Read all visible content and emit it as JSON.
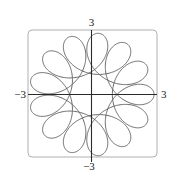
{
  "chart_data": {
    "type": "line",
    "title": "",
    "xlabel": "",
    "ylabel": "",
    "xlim": [
      -3,
      3
    ],
    "ylim": [
      -3,
      3
    ],
    "grid": false,
    "legend": null,
    "tick_labels": {
      "x_min": "−3",
      "x_max": "3",
      "y_min": "−3",
      "y_max": "3"
    },
    "curve": {
      "kind": "parametric",
      "description": "Closed parametric rosette curve with outer loops reaching radius ~3 and inward cusp points near radius ~1",
      "x_expr": "2cos(t) + cos(k t)",
      "y_expr": "2sin(t) - sin(k t)",
      "k": 5.5,
      "t_range": [
        0,
        12.566
      ],
      "samples": 1600
    },
    "colors": {
      "curve": "#5a5a5a",
      "axes": "#2a2a2a",
      "frame": "#b0b0b0"
    }
  }
}
